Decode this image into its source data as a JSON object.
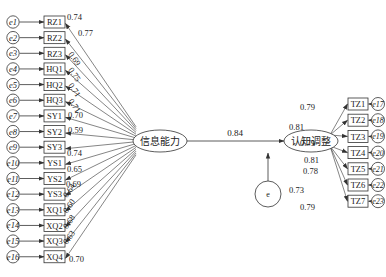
{
  "title": "",
  "latent": {
    "exogenous": {
      "label": "信息能力",
      "cx": 160,
      "cy": 141,
      "rx": 27,
      "ry": 11
    },
    "endogenous": {
      "label": "认知调整",
      "cx": 311,
      "cy": 141,
      "rx": 27,
      "ry": 11
    },
    "disturbance": {
      "label": "e",
      "cx": 268,
      "cy": 194,
      "r": 13
    }
  },
  "path": {
    "from": "信息能力",
    "to": "认知调整",
    "coefficient": "0.84"
  },
  "left_indicators": [
    {
      "name": "RZ1",
      "error": "e1",
      "loading": "0.74"
    },
    {
      "name": "RZ2",
      "error": "e2",
      "loading": "0.77"
    },
    {
      "name": "RZ3",
      "error": "e3",
      "loading": "0.69"
    },
    {
      "name": "HQ1",
      "error": "e4",
      "loading": "0.75"
    },
    {
      "name": "HQ2",
      "error": "e5",
      "loading": "0.71"
    },
    {
      "name": "HQ3",
      "error": "e6",
      "loading": "0.71"
    },
    {
      "name": "SY1",
      "error": "e7",
      "loading": "0.70"
    },
    {
      "name": "SY2",
      "error": "e8",
      "loading": "0.59"
    },
    {
      "name": "SY3",
      "error": "e9",
      "loading": "0.74"
    },
    {
      "name": "YS1",
      "error": "e10",
      "loading": "0.65"
    },
    {
      "name": "YS2",
      "error": "e11",
      "loading": "0.69"
    },
    {
      "name": "YS3",
      "error": "e12",
      "loading": "0.64"
    },
    {
      "name": "XQ1",
      "error": "e13",
      "loading": "0.60"
    },
    {
      "name": "XQ2",
      "error": "e14",
      "loading": "0.68"
    },
    {
      "name": "XQ3",
      "error": "e15",
      "loading": "0.63"
    },
    {
      "name": "XQ4",
      "error": "e16",
      "loading": "0.70"
    }
  ],
  "right_indicators": [
    {
      "name": "TZ1",
      "error": "e17",
      "loading": "0.79"
    },
    {
      "name": "TZ2",
      "error": "e18",
      "loading": "0.81"
    },
    {
      "name": "TZ3",
      "error": "e19",
      "loading": "0.79"
    },
    {
      "name": "TZ4",
      "error": "e20",
      "loading": "0.81"
    },
    {
      "name": "TZ5",
      "error": "e21",
      "loading": "0.78"
    },
    {
      "name": "TZ6",
      "error": "e22",
      "loading": "0.73"
    },
    {
      "name": "TZ7",
      "error": "e23",
      "loading": "0.79"
    }
  ],
  "colors": {
    "stroke": "#333333",
    "text": "#222222",
    "background": "#ffffff"
  }
}
